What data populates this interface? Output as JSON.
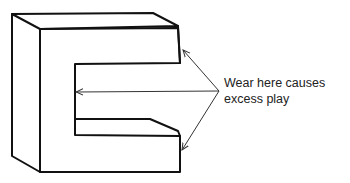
{
  "figure": {
    "callout": {
      "line1": "Wear here causes",
      "line2": "excess play"
    },
    "arrows": [
      {
        "name": "upper-wear-point",
        "target": "top arm inner corner"
      },
      {
        "name": "slot-back-wear-point",
        "target": "back wall of slot"
      },
      {
        "name": "lower-wear-point",
        "target": "bottom arm inner corner"
      }
    ],
    "colors": {
      "stroke": "#111111",
      "arrow": "#333333",
      "text": "#222222",
      "background": "#ffffff"
    }
  }
}
